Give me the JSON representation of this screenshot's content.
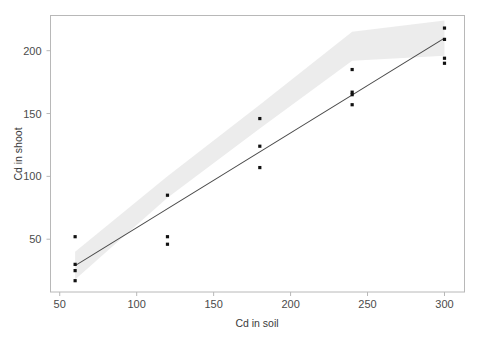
{
  "chart_data": {
    "type": "scatter",
    "title": "",
    "xlabel": "Cd in soil",
    "ylabel": "Cd in shoot",
    "xlim": [
      44,
      313
    ],
    "ylim": [
      8,
      228
    ],
    "xticks": [
      50,
      100,
      150,
      200,
      250,
      300
    ],
    "yticks": [
      50,
      100,
      150,
      200
    ],
    "xtick_labels": [
      "50",
      "100",
      "150",
      "200",
      "250",
      "300"
    ],
    "ytick_labels": [
      "50",
      "100",
      "150",
      "200"
    ],
    "grid": false,
    "legend": null,
    "series": [
      {
        "name": "observations",
        "marker": "square",
        "color": "#111111",
        "points": [
          {
            "x": 60,
            "y": 52
          },
          {
            "x": 60,
            "y": 30
          },
          {
            "x": 60,
            "y": 25
          },
          {
            "x": 60,
            "y": 17
          },
          {
            "x": 120,
            "y": 85
          },
          {
            "x": 120,
            "y": 52
          },
          {
            "x": 120,
            "y": 46
          },
          {
            "x": 180,
            "y": 146
          },
          {
            "x": 180,
            "y": 124
          },
          {
            "x": 180,
            "y": 107
          },
          {
            "x": 240,
            "y": 185
          },
          {
            "x": 240,
            "y": 167
          },
          {
            "x": 240,
            "y": 165
          },
          {
            "x": 240,
            "y": 157
          },
          {
            "x": 300,
            "y": 218
          },
          {
            "x": 300,
            "y": 209
          },
          {
            "x": 300,
            "y": 194
          },
          {
            "x": 300,
            "y": 190
          }
        ]
      }
    ],
    "fit_line": {
      "name": "linear-regression",
      "color": "#4a4a4a",
      "x_start": 60,
      "y_start": 29,
      "x_end": 300,
      "y_end": 210
    },
    "confidence_band": {
      "name": "confidence-interval",
      "color": "#e9e9e9",
      "x": [
        60,
        120,
        180,
        240,
        300
      ],
      "upper": [
        40,
        100,
        157,
        215,
        224
      ],
      "lower": [
        18,
        83,
        138,
        192,
        196
      ]
    }
  },
  "colors": {
    "background": "#ffffff",
    "frame": "#b8b8b8",
    "point": "#111111",
    "line": "#4a4a4a",
    "band": "#e9e9e9",
    "tick_text": "#4b4b4b"
  }
}
